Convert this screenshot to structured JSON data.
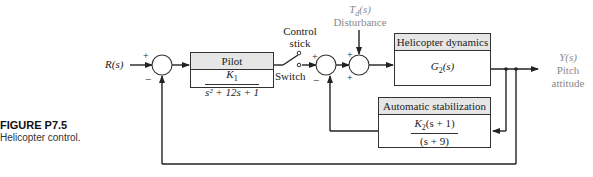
{
  "figure": {
    "label": "FIGURE P7.5",
    "caption": "Helicopter control."
  },
  "input": {
    "label": "R(s)"
  },
  "output": {
    "label": "Y(s)",
    "line1": "Pitch",
    "line2": "attitude"
  },
  "disturbance": {
    "label": "T",
    "subscript": "d",
    "arg": "(s)",
    "name": "Disturbance"
  },
  "switch": {
    "top_line1": "Control",
    "top_line2": "stick",
    "bottom": "Switch"
  },
  "blocks": {
    "pilot": {
      "title": "Pilot",
      "numerator": "K",
      "numerator_sub": "1",
      "denominator": "s² + 12s + 1"
    },
    "helicopter": {
      "title": "Helicopter dynamics",
      "tf": "G",
      "tf_sub": "2",
      "tf_arg": "(s)"
    },
    "stabilization": {
      "title": "Automatic stabilization",
      "numerator": "K",
      "numerator_sub": "2",
      "numerator_rest": "(s + 1)",
      "denominator": "(s + 9)"
    }
  },
  "signs": {
    "sum1_plus": "+",
    "sum1_minus": "−",
    "sum2_plus": "+",
    "sum2_minus": "−",
    "sum3_plus_top": "+",
    "sum3_plus_bottom": "+"
  },
  "colors": {
    "line": "#222222",
    "header_fill": "#e6e6e6",
    "muted_text": "#8a8a8a"
  }
}
